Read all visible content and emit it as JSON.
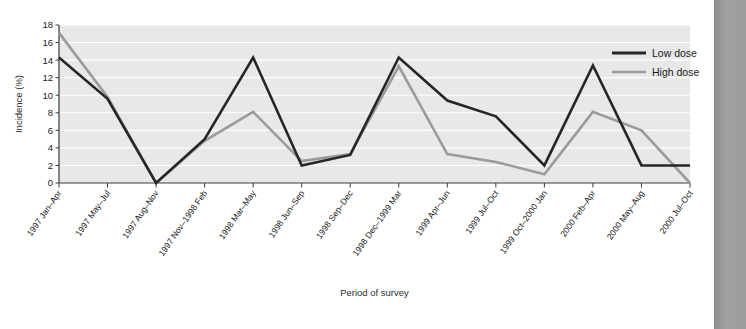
{
  "chart_data": {
    "type": "line",
    "title": "",
    "xlabel": "Period of survey",
    "ylabel": "Incidence (%)",
    "ylim": [
      0,
      18
    ],
    "ytick_step": 2,
    "yticks": [
      0,
      2,
      4,
      6,
      8,
      10,
      12,
      14,
      16,
      18
    ],
    "grid": true,
    "grid_orientation": "horizontal",
    "legend_position": "top-right",
    "plot_background": "#e8e8e8",
    "categories": [
      "1997 Jan–Apr",
      "1997 May–Jul",
      "1997 Aug–Nov",
      "1997 Nov–1998 Feb",
      "1998 Mar–May",
      "1998 Jun–Sep",
      "1998 Sep–Dec",
      "1998 Dec–1999 Mar",
      "1999 Apr–Jun",
      "1999 Jul–Oct",
      "1999 Oct–2000 Jan",
      "2000 Feb–Apr",
      "2000 May–Aug",
      "2000 Jul–Oct"
    ],
    "series": [
      {
        "name": "Low dose",
        "color": "#262626",
        "width": 2.6,
        "values": [
          14.3,
          9.6,
          0.0,
          5.0,
          14.3,
          2.0,
          3.2,
          14.3,
          9.4,
          7.6,
          2.0,
          13.4,
          2.0,
          2.0
        ]
      },
      {
        "name": "High dose",
        "color": "#9b9b9b",
        "width": 2.6,
        "values": [
          17.1,
          9.8,
          0.0,
          4.8,
          8.1,
          2.5,
          3.3,
          13.3,
          3.3,
          2.4,
          1.0,
          8.1,
          6.0,
          0.0
        ]
      }
    ]
  },
  "legend": {
    "items": [
      {
        "label": "Low dose",
        "color": "#262626"
      },
      {
        "label": "High dose",
        "color": "#9b9b9b"
      }
    ]
  },
  "axes": {
    "y_title": "Incidence (%)",
    "x_title": "Period of survey",
    "ytick_labels": [
      "0",
      "2",
      "4",
      "6",
      "8",
      "10",
      "12",
      "14",
      "16",
      "18"
    ]
  }
}
